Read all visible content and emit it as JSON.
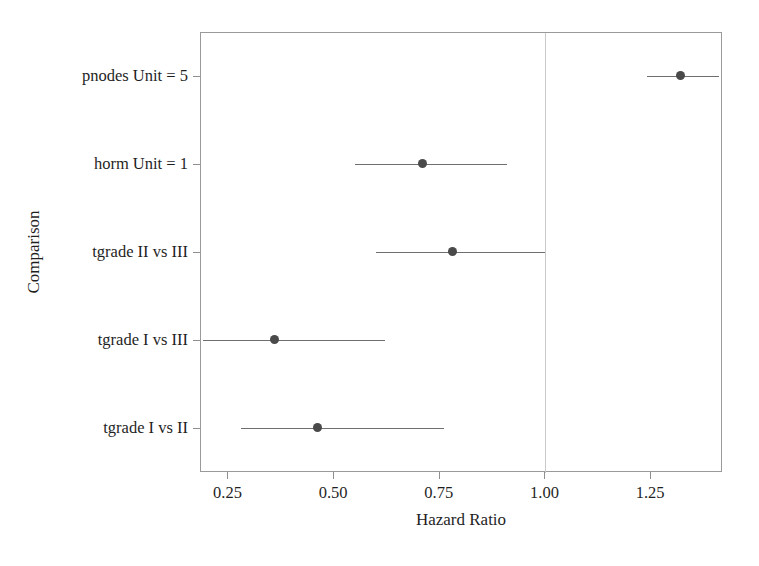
{
  "chart_data": {
    "type": "scatter",
    "subtype": "forest-plot",
    "title": "",
    "xlabel": "Hazard Ratio",
    "ylabel": "Comparison",
    "xlim": [
      0.185,
      1.42
    ],
    "xticks": [
      0.25,
      0.5,
      0.75,
      1.0,
      1.25
    ],
    "xtick_labels": [
      "0.25",
      "0.50",
      "0.75",
      "1.00",
      "1.25"
    ],
    "grid": false,
    "legend": "none",
    "reference_line": {
      "value": 1.0,
      "orientation": "vertical",
      "color": "#c9c9c9"
    },
    "categories": [
      "pnodes Unit = 5",
      "horm Unit = 1",
      "tgrade II vs III",
      "tgrade I vs III",
      "tgrade I vs II"
    ],
    "series": [
      {
        "name": "Hazard Ratio (95% CI)",
        "marker_color": "#4a4a4a",
        "line_color": "#6f6f6f",
        "points": [
          {
            "category": "pnodes Unit = 5",
            "estimate": 1.32,
            "ci_low": 1.24,
            "ci_high": 1.41
          },
          {
            "category": "horm Unit = 1",
            "estimate": 0.71,
            "ci_low": 0.55,
            "ci_high": 0.91
          },
          {
            "category": "tgrade II vs III",
            "estimate": 0.78,
            "ci_low": 0.6,
            "ci_high": 1.0
          },
          {
            "category": "tgrade I vs III",
            "estimate": 0.36,
            "ci_low": 0.19,
            "ci_high": 0.62
          },
          {
            "category": "tgrade I vs II",
            "estimate": 0.46,
            "ci_low": 0.28,
            "ci_high": 0.76
          }
        ]
      }
    ]
  },
  "axis": {
    "x_title": "Hazard Ratio",
    "y_title": "Comparison"
  }
}
